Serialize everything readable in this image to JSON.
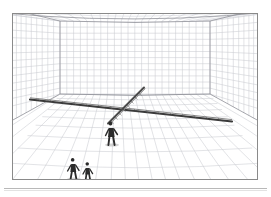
{
  "document": {
    "kind": "scanned-figure",
    "page_background": "#ffffff",
    "caption_rule_color": "#b8b8b8"
  },
  "figure": {
    "name": "perspective-grid-room",
    "frame": {
      "x": 12,
      "y": 13,
      "width": 246,
      "height": 167,
      "border_color": "#8a8a8a",
      "border_width": 1,
      "fill": "#ffffff"
    }
  },
  "colors": {
    "grid_line": "#c9cbd2",
    "grid_line_strong": "#a9acb5",
    "room_edge": "#8f9198",
    "beam_dark": "#3a3a3a",
    "beam_mid": "#6a6a6a",
    "figure_dark": "#2b2b2b",
    "paper": "#ffffff",
    "shadow": "#9a9a9a"
  },
  "scene": {
    "type": "one-point-perspective-room",
    "vanishing_point": {
      "x": 118,
      "y": 88
    },
    "room_back_wall": {
      "x": 46,
      "y": 20,
      "width": 152,
      "height": 74
    },
    "floor_horizon_y": 94,
    "grid": {
      "floor_columns": 26,
      "floor_rows": 14,
      "back_wall_columns": 22,
      "back_wall_rows": 12,
      "side_wall_rows": 12,
      "ceiling_rows": 8
    },
    "beams": [
      {
        "name": "beam-horizontal-main",
        "label": "long transverse beam",
        "from": {
          "x": 30,
          "y": 99
        },
        "to": {
          "x": 232,
          "y": 121
        },
        "color": "#3a3a3a",
        "thickness": 2.1
      },
      {
        "name": "beam-diagonal-receding",
        "label": "receding beam toward vanishing point",
        "from": {
          "x": 108,
          "y": 122
        },
        "to": {
          "x": 141,
          "y": 88
        },
        "color": "#4a4a4a",
        "thickness": 2.0
      }
    ],
    "figures": [
      {
        "name": "figure-center",
        "label": "standing person at beam crossing",
        "x": 112,
        "y": 124,
        "height": 18,
        "color": "#2b2b2b"
      },
      {
        "name": "figure-foreground-left",
        "label": "person at lower left foreground",
        "x": 73,
        "y": 170,
        "height": 16,
        "color": "#2b2b2b"
      },
      {
        "name": "figure-foreground-right",
        "label": "second person at lower foreground",
        "x": 86,
        "y": 171,
        "height": 14,
        "color": "#2b2b2b"
      }
    ]
  }
}
